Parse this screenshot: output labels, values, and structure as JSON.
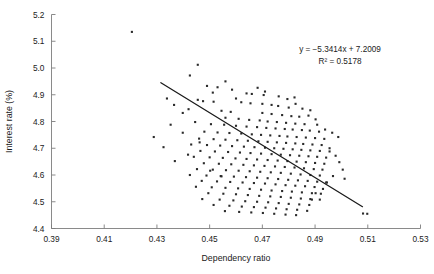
{
  "chart_data": {
    "type": "scatter",
    "title": "",
    "xlabel": "Dependency ratio",
    "ylabel": "Interest rate (%)",
    "xlim": [
      0.39,
      0.53
    ],
    "ylim": [
      4.4,
      5.2
    ],
    "xticks": [
      "0.39",
      "0.41",
      "0.43",
      "0.45",
      "0.47",
      "0.49",
      "0.51",
      "0.53"
    ],
    "yticks": [
      "4.4",
      "4.5",
      "4.6",
      "4.7",
      "4.8",
      "4.9",
      "5.0",
      "5.1",
      "5.2"
    ],
    "xtick_values": [
      0.39,
      0.41,
      0.43,
      0.45,
      0.47,
      0.49,
      0.51,
      0.53
    ],
    "ytick_values": [
      4.4,
      4.5,
      4.6,
      4.7,
      4.8,
      4.9,
      5.0,
      5.1,
      5.2
    ],
    "grid": false,
    "legend": false,
    "marker_color": "#2b2b2b",
    "trendline_color": "#1a1a1a",
    "axis_color": "#7d7d7d",
    "annotation": {
      "equation": "y = −5.3414x + 7.2009",
      "r_squared": "R² = 0.5178",
      "slope": -5.3414,
      "intercept": 7.2009,
      "r2": 0.5178
    },
    "trendline": {
      "x_start": 0.4315,
      "y_start": 4.9452,
      "x_end": 0.508,
      "y_end": 4.4815
    },
    "points": [
      [
        0.4205,
        5.135
      ],
      [
        0.4455,
        5.012
      ],
      [
        0.4425,
        4.972
      ],
      [
        0.456,
        4.95
      ],
      [
        0.449,
        4.933
      ],
      [
        0.453,
        4.928
      ],
      [
        0.4585,
        4.919
      ],
      [
        0.464,
        4.905
      ],
      [
        0.466,
        4.903
      ],
      [
        0.4705,
        4.899
      ],
      [
        0.4455,
        4.881
      ],
      [
        0.4475,
        4.876
      ],
      [
        0.4515,
        4.874
      ],
      [
        0.462,
        4.872
      ],
      [
        0.4655,
        4.868
      ],
      [
        0.47,
        4.866
      ],
      [
        0.4735,
        4.862
      ],
      [
        0.476,
        4.858
      ],
      [
        0.48,
        4.852
      ],
      [
        0.442,
        4.846
      ],
      [
        0.4545,
        4.84
      ],
      [
        0.458,
        4.836
      ],
      [
        0.47,
        4.832
      ],
      [
        0.4735,
        4.828
      ],
      [
        0.4775,
        4.824
      ],
      [
        0.481,
        4.82
      ],
      [
        0.484,
        4.818
      ],
      [
        0.456,
        4.814
      ],
      [
        0.461,
        4.81
      ],
      [
        0.465,
        4.806
      ],
      [
        0.469,
        4.804
      ],
      [
        0.472,
        4.8
      ],
      [
        0.4755,
        4.798
      ],
      [
        0.479,
        4.795
      ],
      [
        0.4825,
        4.792
      ],
      [
        0.486,
        4.79
      ],
      [
        0.4445,
        4.798
      ],
      [
        0.4505,
        4.79
      ],
      [
        0.4555,
        4.788
      ],
      [
        0.46,
        4.784
      ],
      [
        0.464,
        4.781
      ],
      [
        0.468,
        4.779
      ],
      [
        0.4715,
        4.776
      ],
      [
        0.475,
        4.774
      ],
      [
        0.4785,
        4.772
      ],
      [
        0.4815,
        4.77
      ],
      [
        0.485,
        4.768
      ],
      [
        0.488,
        4.766
      ],
      [
        0.4915,
        4.762
      ],
      [
        0.448,
        4.762
      ],
      [
        0.453,
        4.759
      ],
      [
        0.4575,
        4.757
      ],
      [
        0.462,
        4.755
      ],
      [
        0.466,
        4.752
      ],
      [
        0.4695,
        4.75
      ],
      [
        0.473,
        4.748
      ],
      [
        0.4765,
        4.746
      ],
      [
        0.4795,
        4.744
      ],
      [
        0.483,
        4.742
      ],
      [
        0.4865,
        4.74
      ],
      [
        0.49,
        4.738
      ],
      [
        0.4935,
        4.735
      ],
      [
        0.446,
        4.736
      ],
      [
        0.4515,
        4.734
      ],
      [
        0.456,
        4.732
      ],
      [
        0.4605,
        4.73
      ],
      [
        0.4645,
        4.728
      ],
      [
        0.4685,
        4.726
      ],
      [
        0.472,
        4.724
      ],
      [
        0.4755,
        4.722
      ],
      [
        0.479,
        4.72
      ],
      [
        0.4825,
        4.718
      ],
      [
        0.4855,
        4.716
      ],
      [
        0.489,
        4.714
      ],
      [
        0.4925,
        4.712
      ],
      [
        0.443,
        4.714
      ],
      [
        0.449,
        4.712
      ],
      [
        0.454,
        4.71
      ],
      [
        0.4585,
        4.708
      ],
      [
        0.463,
        4.706
      ],
      [
        0.467,
        4.704
      ],
      [
        0.471,
        4.702
      ],
      [
        0.4745,
        4.7
      ],
      [
        0.478,
        4.698
      ],
      [
        0.4815,
        4.696
      ],
      [
        0.4848,
        4.694
      ],
      [
        0.4882,
        4.692
      ],
      [
        0.4918,
        4.69
      ],
      [
        0.4955,
        4.688
      ],
      [
        0.4465,
        4.69
      ],
      [
        0.452,
        4.688
      ],
      [
        0.457,
        4.686
      ],
      [
        0.4615,
        4.684
      ],
      [
        0.4655,
        4.682
      ],
      [
        0.4695,
        4.68
      ],
      [
        0.4735,
        4.678
      ],
      [
        0.477,
        4.676
      ],
      [
        0.4805,
        4.674
      ],
      [
        0.484,
        4.672
      ],
      [
        0.4875,
        4.67
      ],
      [
        0.4908,
        4.668
      ],
      [
        0.4942,
        4.665
      ],
      [
        0.444,
        4.668
      ],
      [
        0.45,
        4.666
      ],
      [
        0.455,
        4.664
      ],
      [
        0.4598,
        4.662
      ],
      [
        0.464,
        4.66
      ],
      [
        0.468,
        4.658
      ],
      [
        0.472,
        4.656
      ],
      [
        0.4758,
        4.654
      ],
      [
        0.4795,
        4.652
      ],
      [
        0.483,
        4.65
      ],
      [
        0.4865,
        4.648
      ],
      [
        0.49,
        4.645
      ],
      [
        0.4935,
        4.642
      ],
      [
        0.4478,
        4.644
      ],
      [
        0.4535,
        4.642
      ],
      [
        0.4582,
        4.64
      ],
      [
        0.4628,
        4.638
      ],
      [
        0.4668,
        4.636
      ],
      [
        0.4708,
        4.634
      ],
      [
        0.4748,
        4.632
      ],
      [
        0.4785,
        4.63
      ],
      [
        0.4822,
        4.628
      ],
      [
        0.4858,
        4.625
      ],
      [
        0.4895,
        4.622
      ],
      [
        0.4928,
        4.62
      ],
      [
        0.4452,
        4.622
      ],
      [
        0.4512,
        4.62
      ],
      [
        0.4562,
        4.618
      ],
      [
        0.461,
        4.616
      ],
      [
        0.4652,
        4.614
      ],
      [
        0.4692,
        4.612
      ],
      [
        0.4732,
        4.61
      ],
      [
        0.477,
        4.608
      ],
      [
        0.4808,
        4.605
      ],
      [
        0.4845,
        4.602
      ],
      [
        0.4882,
        4.6
      ],
      [
        0.4918,
        4.598
      ],
      [
        0.4425,
        4.6
      ],
      [
        0.4488,
        4.598
      ],
      [
        0.4542,
        4.596
      ],
      [
        0.4592,
        4.594
      ],
      [
        0.4638,
        4.592
      ],
      [
        0.468,
        4.59
      ],
      [
        0.472,
        4.588
      ],
      [
        0.476,
        4.585
      ],
      [
        0.4798,
        4.582
      ],
      [
        0.4835,
        4.58
      ],
      [
        0.4872,
        4.578
      ],
      [
        0.4908,
        4.575
      ],
      [
        0.4945,
        4.572
      ],
      [
        0.447,
        4.578
      ],
      [
        0.4528,
        4.576
      ],
      [
        0.4578,
        4.574
      ],
      [
        0.4625,
        4.572
      ],
      [
        0.4668,
        4.57
      ],
      [
        0.471,
        4.568
      ],
      [
        0.475,
        4.565
      ],
      [
        0.4788,
        4.562
      ],
      [
        0.4825,
        4.56
      ],
      [
        0.4862,
        4.558
      ],
      [
        0.4898,
        4.555
      ],
      [
        0.4448,
        4.556
      ],
      [
        0.4508,
        4.554
      ],
      [
        0.456,
        4.552
      ],
      [
        0.4608,
        4.55
      ],
      [
        0.4652,
        4.548
      ],
      [
        0.4695,
        4.545
      ],
      [
        0.4735,
        4.542
      ],
      [
        0.4775,
        4.54
      ],
      [
        0.4812,
        4.538
      ],
      [
        0.485,
        4.535
      ],
      [
        0.4888,
        4.532
      ],
      [
        0.4922,
        4.53
      ],
      [
        0.4495,
        4.532
      ],
      [
        0.4552,
        4.53
      ],
      [
        0.46,
        4.528
      ],
      [
        0.4645,
        4.525
      ],
      [
        0.4688,
        4.522
      ],
      [
        0.473,
        4.52
      ],
      [
        0.477,
        4.518
      ],
      [
        0.4808,
        4.515
      ],
      [
        0.4846,
        4.512
      ],
      [
        0.4882,
        4.51
      ],
      [
        0.4918,
        4.508
      ],
      [
        0.4472,
        4.51
      ],
      [
        0.4538,
        4.508
      ],
      [
        0.459,
        4.505
      ],
      [
        0.4635,
        4.502
      ],
      [
        0.468,
        4.5
      ],
      [
        0.4722,
        4.498
      ],
      [
        0.4762,
        4.495
      ],
      [
        0.48,
        4.492
      ],
      [
        0.484,
        4.49
      ],
      [
        0.4878,
        4.488
      ],
      [
        0.4515,
        4.488
      ],
      [
        0.4575,
        4.485
      ],
      [
        0.4622,
        4.482
      ],
      [
        0.4668,
        4.48
      ],
      [
        0.4712,
        4.478
      ],
      [
        0.4752,
        4.475
      ],
      [
        0.4792,
        4.472
      ],
      [
        0.4832,
        4.47
      ],
      [
        0.487,
        4.466
      ],
      [
        0.4558,
        4.465
      ],
      [
        0.4612,
        4.462
      ],
      [
        0.4658,
        4.46
      ],
      [
        0.4702,
        4.458
      ],
      [
        0.4745,
        4.455
      ],
      [
        0.4788,
        4.452
      ],
      [
        0.4828,
        4.45
      ],
      [
        0.5082,
        4.456
      ],
      [
        0.5098,
        4.455
      ],
      [
        0.4955,
        4.7
      ],
      [
        0.4978,
        4.672
      ],
      [
        0.4992,
        4.648
      ],
      [
        0.5005,
        4.62
      ],
      [
        0.4968,
        4.596
      ],
      [
        0.4942,
        4.572
      ],
      [
        0.493,
        4.548
      ],
      [
        0.4902,
        4.532
      ],
      [
        0.4888,
        4.508
      ],
      [
        0.5012,
        4.586
      ],
      [
        0.4965,
        4.758
      ],
      [
        0.4988,
        4.742
      ],
      [
        0.4908,
        4.788
      ],
      [
        0.4938,
        4.77
      ],
      [
        0.4875,
        4.822
      ],
      [
        0.4902,
        4.808
      ],
      [
        0.4852,
        4.848
      ],
      [
        0.4826,
        4.866
      ],
      [
        0.4882,
        4.842
      ],
      [
        0.4795,
        4.884
      ],
      [
        0.4762,
        4.894
      ],
      [
        0.4822,
        4.89
      ],
      [
        0.471,
        4.912
      ],
      [
        0.4682,
        4.926
      ],
      [
        0.46,
        4.886
      ],
      [
        0.4512,
        4.908
      ],
      [
        0.4398,
        4.832
      ],
      [
        0.4365,
        4.862
      ],
      [
        0.4338,
        4.886
      ],
      [
        0.4462,
        4.722
      ],
      [
        0.4398,
        4.758
      ],
      [
        0.4352,
        4.788
      ],
      [
        0.4418,
        4.676
      ],
      [
        0.4368,
        4.652
      ],
      [
        0.4502,
        4.616
      ],
      [
        0.4545,
        4.595
      ],
      [
        0.4325,
        4.704
      ],
      [
        0.4288,
        4.742
      ]
    ]
  }
}
